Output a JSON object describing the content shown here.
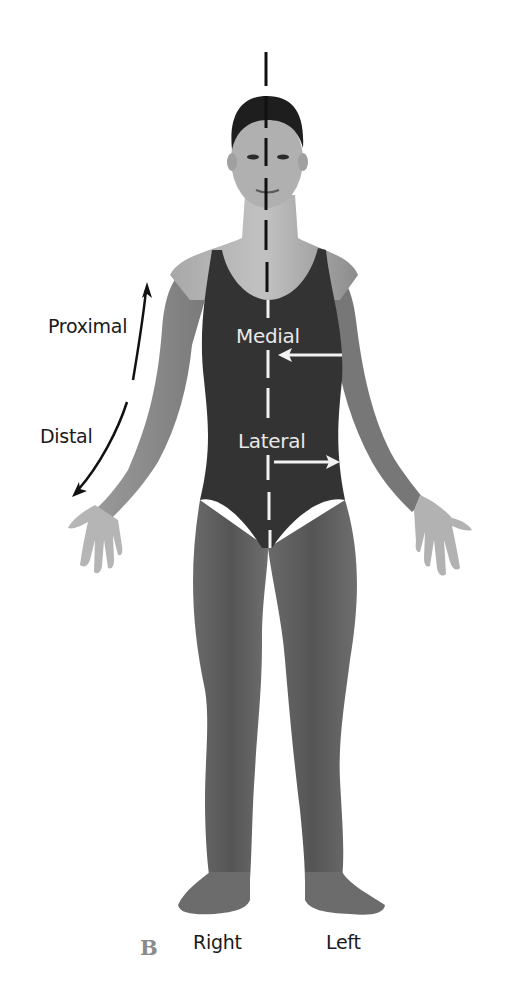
{
  "figure": {
    "panel_letter": "B",
    "labels": {
      "proximal": "Proximal",
      "distal": "Distal",
      "medial": "Medial",
      "lateral": "Lateral",
      "right": "Right",
      "left": "Left"
    },
    "colors": {
      "background": "#ffffff",
      "skin_light": "#b8b8b8",
      "skin_mid": "#8e8e8e",
      "skin_dark": "#5a5a5a",
      "swimsuit": "#333333",
      "hair": "#1e1e1e",
      "midline_on_skin": "#111111",
      "midline_on_suit": "#f2f2f2",
      "arrow_dark": "#111111",
      "arrow_light": "#f2f2f2",
      "panel_letter": "#8a8a8a"
    }
  }
}
